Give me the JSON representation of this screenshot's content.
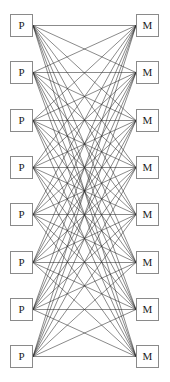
{
  "figure": {
    "background_color": "#ffffff",
    "width": 170,
    "height": 382
  },
  "style": {
    "edge_color": "#2b2b2b",
    "edge_width": 0.55,
    "node_fill": "#ffffff",
    "node_border_color": "#8a8a8a",
    "node_border_width": 1,
    "label_color": "#1a1a1a",
    "node_width": 23,
    "node_height": 23
  },
  "layout": {
    "left_column_x": 10,
    "right_column_x": 136,
    "first_row_y": 14,
    "row_spacing": 47.3,
    "row_count": 8
  },
  "chart_data": {
    "type": "diagram",
    "subtype": "bipartite-graph",
    "left_set_label": "P",
    "right_set_label": "M",
    "left_nodes": [
      {
        "id": "P1",
        "label": "P",
        "x": 10,
        "y": 14
      },
      {
        "id": "P2",
        "label": "P",
        "x": 10,
        "y": 61
      },
      {
        "id": "P3",
        "label": "P",
        "x": 10,
        "y": 109
      },
      {
        "id": "P4",
        "label": "P",
        "x": 10,
        "y": 156
      },
      {
        "id": "P5",
        "label": "P",
        "x": 10,
        "y": 203
      },
      {
        "id": "P6",
        "label": "P",
        "x": 10,
        "y": 251
      },
      {
        "id": "P7",
        "label": "P",
        "x": 10,
        "y": 298
      },
      {
        "id": "P8",
        "label": "P",
        "x": 10,
        "y": 345
      }
    ],
    "right_nodes": [
      {
        "id": "M1",
        "label": "M",
        "x": 136,
        "y": 14
      },
      {
        "id": "M2",
        "label": "M",
        "x": 136,
        "y": 61
      },
      {
        "id": "M3",
        "label": "M",
        "x": 136,
        "y": 109
      },
      {
        "id": "M4",
        "label": "M",
        "x": 136,
        "y": 156
      },
      {
        "id": "M5",
        "label": "M",
        "x": 136,
        "y": 203
      },
      {
        "id": "M6",
        "label": "M",
        "x": 136,
        "y": 251
      },
      {
        "id": "M7",
        "label": "M",
        "x": 136,
        "y": 298
      },
      {
        "id": "M8",
        "label": "M",
        "x": 136,
        "y": 345
      }
    ],
    "edge_count": 64,
    "complete_bipartite": true,
    "edges": [
      [
        "P1",
        "M1"
      ],
      [
        "P1",
        "M2"
      ],
      [
        "P1",
        "M3"
      ],
      [
        "P1",
        "M4"
      ],
      [
        "P1",
        "M5"
      ],
      [
        "P1",
        "M6"
      ],
      [
        "P1",
        "M7"
      ],
      [
        "P1",
        "M8"
      ],
      [
        "P2",
        "M1"
      ],
      [
        "P2",
        "M2"
      ],
      [
        "P2",
        "M3"
      ],
      [
        "P2",
        "M4"
      ],
      [
        "P2",
        "M5"
      ],
      [
        "P2",
        "M6"
      ],
      [
        "P2",
        "M7"
      ],
      [
        "P2",
        "M8"
      ],
      [
        "P3",
        "M1"
      ],
      [
        "P3",
        "M2"
      ],
      [
        "P3",
        "M3"
      ],
      [
        "P3",
        "M4"
      ],
      [
        "P3",
        "M5"
      ],
      [
        "P3",
        "M6"
      ],
      [
        "P3",
        "M7"
      ],
      [
        "P3",
        "M8"
      ],
      [
        "P4",
        "M1"
      ],
      [
        "P4",
        "M2"
      ],
      [
        "P4",
        "M3"
      ],
      [
        "P4",
        "M4"
      ],
      [
        "P4",
        "M5"
      ],
      [
        "P4",
        "M6"
      ],
      [
        "P4",
        "M7"
      ],
      [
        "P4",
        "M8"
      ],
      [
        "P5",
        "M1"
      ],
      [
        "P5",
        "M2"
      ],
      [
        "P5",
        "M3"
      ],
      [
        "P5",
        "M4"
      ],
      [
        "P5",
        "M5"
      ],
      [
        "P5",
        "M6"
      ],
      [
        "P5",
        "M7"
      ],
      [
        "P5",
        "M8"
      ],
      [
        "P6",
        "M1"
      ],
      [
        "P6",
        "M2"
      ],
      [
        "P6",
        "M3"
      ],
      [
        "P6",
        "M4"
      ],
      [
        "P6",
        "M5"
      ],
      [
        "P6",
        "M6"
      ],
      [
        "P6",
        "M7"
      ],
      [
        "P6",
        "M8"
      ],
      [
        "P7",
        "M1"
      ],
      [
        "P7",
        "M2"
      ],
      [
        "P7",
        "M3"
      ],
      [
        "P7",
        "M4"
      ],
      [
        "P7",
        "M5"
      ],
      [
        "P7",
        "M6"
      ],
      [
        "P7",
        "M7"
      ],
      [
        "P7",
        "M8"
      ],
      [
        "P8",
        "M1"
      ],
      [
        "P8",
        "M2"
      ],
      [
        "P8",
        "M3"
      ],
      [
        "P8",
        "M4"
      ],
      [
        "P8",
        "M5"
      ],
      [
        "P8",
        "M6"
      ],
      [
        "P8",
        "M7"
      ],
      [
        "P8",
        "M8"
      ]
    ]
  }
}
